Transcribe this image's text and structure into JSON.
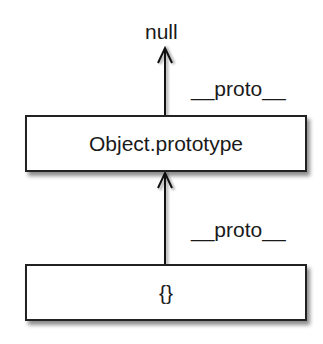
{
  "diagram": {
    "terminal": {
      "label": "null"
    },
    "nodes": [
      {
        "id": "object-prototype",
        "label": "Object.prototype"
      },
      {
        "id": "empty-object",
        "label": "{}"
      }
    ],
    "edges": [
      {
        "from": "object-prototype",
        "to": "null",
        "label": "__proto__"
      },
      {
        "from": "empty-object",
        "to": "object-prototype",
        "label": "__proto__"
      }
    ]
  }
}
